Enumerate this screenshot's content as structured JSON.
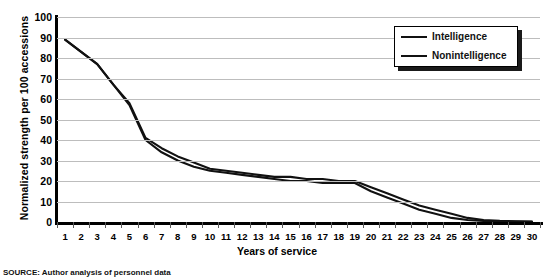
{
  "chart_data": {
    "type": "line",
    "title": "",
    "xlabel": "Years of service",
    "ylabel": "Normalized strength per 100 accessions",
    "xlim": [
      1,
      30
    ],
    "ylim": [
      0,
      100
    ],
    "grid": "horizontal",
    "legend_position": "top-right",
    "x": [
      1,
      2,
      3,
      4,
      5,
      6,
      7,
      8,
      9,
      10,
      11,
      12,
      13,
      14,
      15,
      16,
      17,
      18,
      19,
      20,
      21,
      22,
      23,
      24,
      25,
      26,
      27,
      28,
      29,
      30
    ],
    "xticklabels": [
      "1",
      "2",
      "3",
      "4",
      "5",
      "6",
      "7",
      "8",
      "9",
      "10",
      "11",
      "12",
      "13",
      "14",
      "15",
      "16",
      "17",
      "18",
      "19",
      "20",
      "21",
      "22",
      "23",
      "24",
      "25",
      "26",
      "27",
      "28",
      "29",
      "30"
    ],
    "yticklabels": [
      "0",
      "10",
      "20",
      "30",
      "40",
      "50",
      "60",
      "70",
      "80",
      "90",
      "100"
    ],
    "yticks": [
      0,
      10,
      20,
      30,
      40,
      50,
      60,
      70,
      80,
      90,
      100
    ],
    "series": [
      {
        "name": "Intelligence",
        "color": "#111111",
        "values": [
          89,
          83,
          77,
          67,
          58,
          41,
          36,
          32,
          29,
          26,
          25,
          24,
          23,
          22,
          22,
          21,
          21,
          20,
          20,
          17,
          14,
          11,
          8,
          6,
          4,
          2,
          1,
          0.6,
          0.4,
          0.2
        ]
      },
      {
        "name": "Nonintelligence",
        "color": "#111111",
        "values": [
          89,
          83,
          77,
          67,
          57,
          40,
          34,
          30,
          27,
          25,
          24,
          23,
          22,
          21,
          20,
          20,
          19,
          19,
          19,
          15,
          12,
          9,
          6,
          4,
          2,
          1,
          0.5,
          0.3,
          0.2,
          0.1
        ]
      }
    ]
  },
  "legend": {
    "entries": [
      {
        "label": "Intelligence"
      },
      {
        "label": "Nonintelligence"
      }
    ]
  },
  "axes": {
    "y_title": "Normalized strength per 100 accessions",
    "x_title": "Years of service"
  },
  "caption": {
    "source_text": "SOURCE: Author analysis of personnel data"
  },
  "colors": {
    "line": "#111111",
    "gridline": "#bdbdbd",
    "axis": "#000000",
    "background": "#ffffff"
  }
}
